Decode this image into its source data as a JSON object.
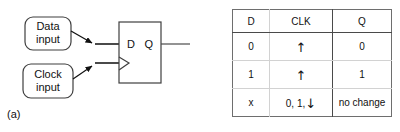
{
  "figure": {
    "panel_a": {
      "caption": "(a)",
      "data_input_box": {
        "line1": "Data",
        "line2": "input"
      },
      "clock_input_box": {
        "line1": "Clock",
        "line2": "input"
      },
      "flipflop": {
        "d_pin_label": "D",
        "q_pin_label": "Q",
        "clock_marker": "dynamic-input-triangle"
      }
    },
    "panel_b": {
      "caption": "(b)",
      "table": {
        "headers": [
          "D",
          "CLK",
          "Q"
        ],
        "rows": [
          {
            "d": "0",
            "clk": "",
            "clk_arrow": "↑",
            "q": "0"
          },
          {
            "d": "1",
            "clk": "",
            "clk_arrow": "↑",
            "q": "1"
          },
          {
            "d": "x",
            "clk": "0, 1,",
            "clk_arrow": "↓",
            "q": "no change"
          }
        ]
      }
    }
  },
  "colors": {
    "stroke": "#3f3f3f",
    "text": "#111111",
    "table_border": "#6e6e6e",
    "table_divider_dark": "#4a4a4a",
    "table_divider_light": "#d2d2d2"
  }
}
